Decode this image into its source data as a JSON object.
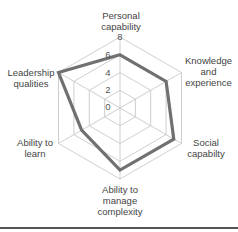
{
  "chart_data": {
    "type": "radar",
    "title": "",
    "categories": [
      "Personal capability",
      "Knowledge and experience",
      "Social capabilty",
      "Ability to manage complexity",
      "Ability to learn",
      "Leadership qualities"
    ],
    "series": [
      {
        "name": "Series 1",
        "values": [
          6,
          6,
          7,
          7,
          5,
          8
        ],
        "color": "#707070"
      }
    ],
    "axis_ticks": [
      "0",
      "2",
      "4",
      "6",
      "8"
    ],
    "rlim": [
      0,
      8
    ],
    "grid": true,
    "legend": "none"
  },
  "labels": {
    "personal": "Personal\ncapability",
    "knowledge": "Knowledge\nand\nexperience",
    "social": "Social\ncapabilty",
    "complexity": "Ability to\nmanage\ncomplexity",
    "learn": "Ability to\nlearn",
    "leadership": "Leadership\nqualities"
  },
  "ticks": {
    "t0": "0",
    "t2": "2",
    "t4": "4",
    "t6": "6",
    "t8": "8"
  },
  "colors": {
    "grid": "#c8c8c8",
    "series": "#707070"
  }
}
